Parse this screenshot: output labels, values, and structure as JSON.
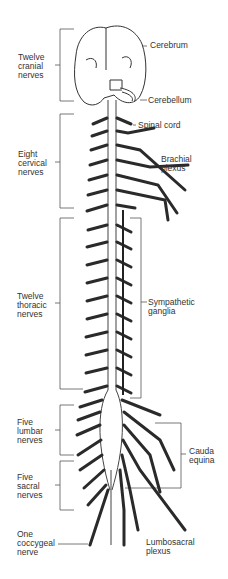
{
  "diagram": {
    "left_labels": [
      {
        "id": "cranial",
        "text": "Twelve\ncranial\nnerves"
      },
      {
        "id": "cervical",
        "text": "Eight\ncervical\nnerves"
      },
      {
        "id": "thoracic",
        "text": "Twelve\nthoracic\nnerves"
      },
      {
        "id": "lumbar",
        "text": "Five\nlumbar\nnerves"
      },
      {
        "id": "sacral",
        "text": "Five\nsacral\nnerves"
      },
      {
        "id": "coccygeal",
        "text": "One\ncoccygeal\nnerve"
      }
    ],
    "right_labels": [
      {
        "id": "cerebrum",
        "text": "Cerebrum"
      },
      {
        "id": "cerebellum",
        "text": "Cerebellum"
      },
      {
        "id": "spinal_cord",
        "text": "Spinal cord"
      },
      {
        "id": "brachial",
        "text": "Brachial\nplexus"
      },
      {
        "id": "sympathetic",
        "text": "Sympathetic\nganglia"
      },
      {
        "id": "cauda",
        "text": "Cauda\nequina"
      },
      {
        "id": "lumbosacral",
        "text": "Lumbosacral\nplexus"
      }
    ]
  }
}
